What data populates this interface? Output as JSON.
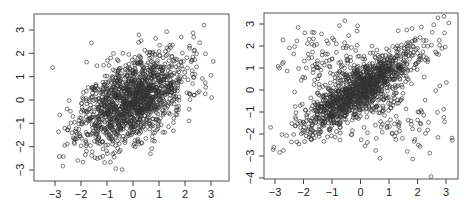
{
  "chart_data": [
    {
      "type": "scatter",
      "title": "",
      "xlabel": "",
      "ylabel": "",
      "xlim": [
        -3.4,
        3.5
      ],
      "ylim": [
        -3.4,
        3.7
      ],
      "x_ticks": [
        -3,
        -2,
        -1,
        0,
        1,
        2,
        3
      ],
      "y_ticks": [
        -3,
        -2,
        -1,
        0,
        1,
        2,
        3
      ],
      "x_tick_labels": [
        "−3",
        "−2",
        "−1",
        "0",
        "1",
        "2",
        "3"
      ],
      "y_tick_labels": [
        "−3",
        "−2",
        "−1",
        "0",
        "1",
        "2",
        "3"
      ],
      "grid": false,
      "legend": null,
      "marker": "open-circle",
      "point_color": "#333333",
      "description": "Bivariate normal sample, moderate positive correlation",
      "n_points": 1500,
      "distribution": {
        "kind": "bivariate-normal",
        "mean": [
          0,
          0
        ],
        "sd": [
          1,
          1
        ],
        "correlation": 0.5,
        "seed": 11
      }
    },
    {
      "type": "scatter",
      "title": "",
      "xlabel": "",
      "ylabel": "",
      "xlim": [
        -3.3,
        3.3
      ],
      "ylim": [
        -4.05,
        3.4
      ],
      "x_ticks": [
        -3,
        -2,
        -1,
        0,
        1,
        2,
        3
      ],
      "y_ticks": [
        -4,
        -3,
        -2,
        -1,
        0,
        1,
        2,
        3
      ],
      "x_tick_labels": [
        "−3",
        "−2",
        "−1",
        "0",
        "1",
        "2",
        "3"
      ],
      "y_tick_labels": [
        "−4",
        "−3",
        "−2",
        "−1",
        "0",
        "1",
        "2",
        "3"
      ],
      "grid": false,
      "legend": null,
      "marker": "open-circle",
      "point_color": "#333333",
      "description": "Mixture: strongly correlated main cluster plus anti-diagonal arms forming an X shape",
      "n_points": 1500,
      "distribution": {
        "kind": "mixture",
        "components": [
          {
            "weight": 0.75,
            "correlation": 0.85
          },
          {
            "weight": 0.25,
            "correlation": -0.6
          }
        ],
        "seed": 29
      }
    }
  ],
  "panels": [
    {
      "box": {
        "left": 34,
        "top": 14,
        "right": 229,
        "bottom": 181
      },
      "x_px": {
        "-3": 55,
        "3": 211
      },
      "y_px": {
        "3": 30,
        "-3": 170
      }
    },
    {
      "box": {
        "left": 264,
        "top": 13,
        "right": 458,
        "bottom": 179
      },
      "x_px": {
        "-3": 275,
        "3": 446
      },
      "y_px": {
        "3": 24,
        "-4": 178
      }
    }
  ]
}
